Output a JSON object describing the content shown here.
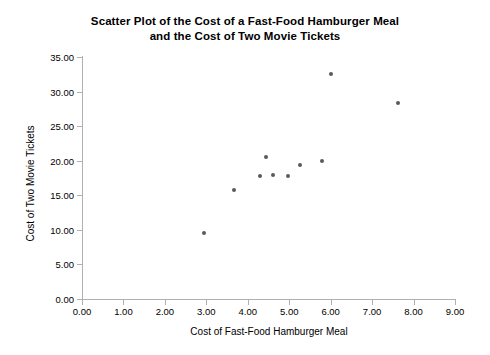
{
  "chart_data": {
    "type": "scatter",
    "title": "Scatter Plot of the Cost of a Fast-Food Hamburger Meal and the Cost of Two Movie Tickets",
    "title_lines": [
      "Scatter Plot of the Cost of a Fast-Food Hamburger Meal",
      "and the Cost of Two Movie Tickets"
    ],
    "xlabel": "Cost of Fast-Food Hamburger Meal",
    "ylabel": "Cost of Two Movie Tickets",
    "xlim": [
      0,
      9
    ],
    "ylim": [
      0,
      35
    ],
    "xticks": [
      0,
      1,
      2,
      3,
      4,
      5,
      6,
      7,
      8,
      9
    ],
    "yticks": [
      0,
      5,
      10,
      15,
      20,
      25,
      30,
      35
    ],
    "xtick_labels": [
      "0.00",
      "1.00",
      "2.00",
      "3.00",
      "4.00",
      "5.00",
      "6.00",
      "7.00",
      "8.00",
      "9.00"
    ],
    "ytick_labels": [
      "0.00",
      "5.00",
      "10.00",
      "15.00",
      "20.00",
      "25.00",
      "30.00",
      "35.00"
    ],
    "grid": false,
    "legend": false,
    "marker_color": "#5a5a5a",
    "axis_color": "#b0b0b0",
    "background": "#ffffff",
    "points": [
      {
        "x": 2.95,
        "y": 9.6
      },
      {
        "x": 3.67,
        "y": 15.8
      },
      {
        "x": 4.3,
        "y": 17.8
      },
      {
        "x": 4.45,
        "y": 20.6
      },
      {
        "x": 4.61,
        "y": 17.9
      },
      {
        "x": 4.97,
        "y": 17.8
      },
      {
        "x": 5.27,
        "y": 19.4
      },
      {
        "x": 5.8,
        "y": 19.9
      },
      {
        "x": 6.02,
        "y": 32.6
      },
      {
        "x": 7.63,
        "y": 28.4
      }
    ]
  }
}
